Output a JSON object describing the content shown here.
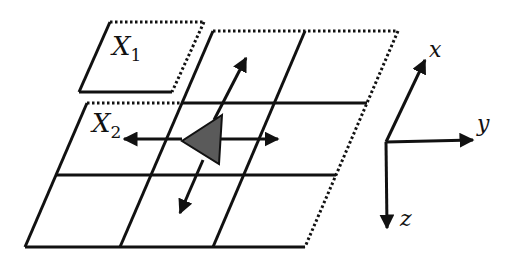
{
  "diagram": {
    "type": "grid-with-coordinate-axes",
    "colors": {
      "line": "#111111",
      "triangle_fill": "#5a5a5a",
      "background": "#ffffff"
    },
    "regions": [
      {
        "id": "X1",
        "label": "X",
        "subscript": "1",
        "style": "solid-left-bottom, dotted-top-right"
      },
      {
        "id": "X2",
        "label": "X",
        "subscript": "2",
        "style": "3x3 parallelogram grid, dotted top-left and right edges"
      }
    ],
    "marker": {
      "shape": "triangle",
      "arrows": [
        "left",
        "right",
        "up",
        "down"
      ]
    },
    "axes": [
      {
        "name": "x",
        "label": "x",
        "direction": "up-right"
      },
      {
        "name": "y",
        "label": "y",
        "direction": "right"
      },
      {
        "name": "z",
        "label": "z",
        "direction": "down"
      }
    ]
  }
}
